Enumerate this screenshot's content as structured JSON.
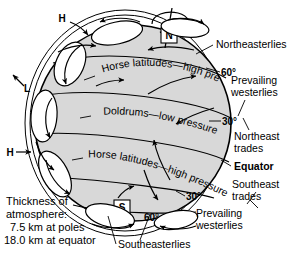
{
  "diagram": {
    "globe": {
      "north_pole_label": "N",
      "south_pole_label": "S",
      "rotation_icon": "rotation-arrow"
    },
    "pressure_markers": [
      {
        "id": "h-top",
        "label": "H",
        "meaning": "high-pressure"
      },
      {
        "id": "l-left",
        "label": "L",
        "meaning": "low-pressure"
      },
      {
        "id": "h-left",
        "label": "H",
        "meaning": "high-pressure"
      }
    ],
    "belt_labels": [
      {
        "id": "horse-north",
        "text": "Horse latitudes—high pressure"
      },
      {
        "id": "doldrums",
        "text": "Doldrums—low pressure"
      },
      {
        "id": "horse-south",
        "text": "Horse latitudes—high pressure"
      }
    ],
    "latitude_marks": [
      {
        "id": "lat-60n",
        "text": "60°"
      },
      {
        "id": "lat-30n",
        "text": "30°"
      },
      {
        "id": "lat-30s",
        "text": "30°"
      },
      {
        "id": "lat-60s",
        "text": "60°"
      }
    ],
    "wind_labels": [
      {
        "id": "northeasterlies",
        "text": "Northeasterlies",
        "bold": false
      },
      {
        "id": "prevailing-westerlies-n-1",
        "text": "Prevailing",
        "bold": false
      },
      {
        "id": "prevailing-westerlies-n-2",
        "text": "westerlies",
        "bold": false
      },
      {
        "id": "northeast-trades-1",
        "text": "Northeast",
        "bold": false
      },
      {
        "id": "northeast-trades-2",
        "text": "trades",
        "bold": false
      },
      {
        "id": "equator",
        "text": "Equator",
        "bold": true
      },
      {
        "id": "southeast-trades-1",
        "text": "Southeast",
        "bold": false
      },
      {
        "id": "southeast-trades-2",
        "text": "trades",
        "bold": false
      },
      {
        "id": "prevailing-westerlies-s-1",
        "text": "Prevailing",
        "bold": false
      },
      {
        "id": "prevailing-westerlies-s-2",
        "text": "westerlies",
        "bold": false
      },
      {
        "id": "southeasterlies",
        "text": "Southeasterlies",
        "bold": false
      }
    ],
    "caption": {
      "line1": "Thickness of",
      "line2": "atmosphere:",
      "line3": "7.5 km at poles",
      "line4": "18.0 km at equator"
    },
    "colors": {
      "globe_fill": "#d8d8d8",
      "line": "#000000",
      "background": "#ffffff"
    }
  }
}
